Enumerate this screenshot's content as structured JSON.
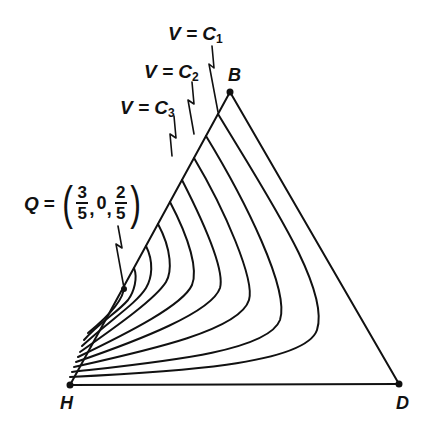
{
  "diagram": {
    "type": "ternary-simplex-level-curves",
    "vertices": {
      "H": {
        "label": "H",
        "x": 70,
        "y": 385
      },
      "B": {
        "label": "B",
        "x": 230,
        "y": 92
      },
      "D": {
        "label": "D",
        "x": 399,
        "y": 384
      }
    },
    "level_labels": [
      {
        "id": "c1",
        "prefix": "V = C",
        "sub": "1"
      },
      {
        "id": "c2",
        "prefix": "V = C",
        "sub": "2"
      },
      {
        "id": "c3",
        "prefix": "V = C",
        "sub": "3"
      }
    ],
    "point_q": {
      "name": "Q",
      "eq": "=",
      "coords": [
        {
          "num": "3",
          "den": "5"
        },
        {
          "value": "0"
        },
        {
          "num": "2",
          "den": "5"
        }
      ],
      "separator": ","
    },
    "stroke_color": "#111111",
    "background": "#ffffff",
    "curve_count": 10
  }
}
